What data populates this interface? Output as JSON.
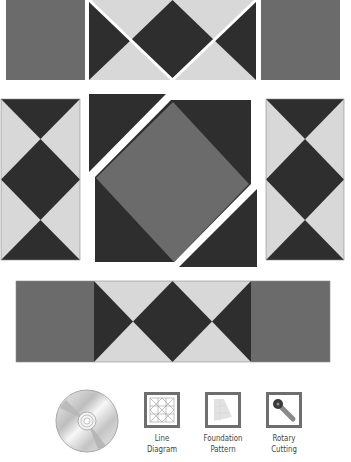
{
  "diagram": {
    "colors": {
      "medium": "#6b6b6b",
      "dark": "#2e2e2e",
      "light": "#d8d8d8",
      "background": "#ffffff",
      "icon_border": "#6e6e6e"
    },
    "rows": [
      {
        "name": "top-row",
        "pieces": [
          "medium-square",
          "flying-geese-strip-cut",
          "medium-square"
        ]
      },
      {
        "name": "middle-row",
        "pieces": [
          "hourglass-column",
          "square-in-square-center",
          "hourglass-column"
        ]
      },
      {
        "name": "bottom-row",
        "pieces": [
          "assembled-border-strip"
        ]
      }
    ]
  },
  "legend": {
    "cd_icon": "cd-disc-icon",
    "items": [
      {
        "icon": "line-diagram-icon",
        "line1": "Line",
        "line2": "Diagram"
      },
      {
        "icon": "foundation-pattern-icon",
        "line1": "Foundation",
        "line2": "Pattern"
      },
      {
        "icon": "rotary-cutting-icon",
        "line1": "Rotary",
        "line2": "Cutting"
      }
    ]
  }
}
